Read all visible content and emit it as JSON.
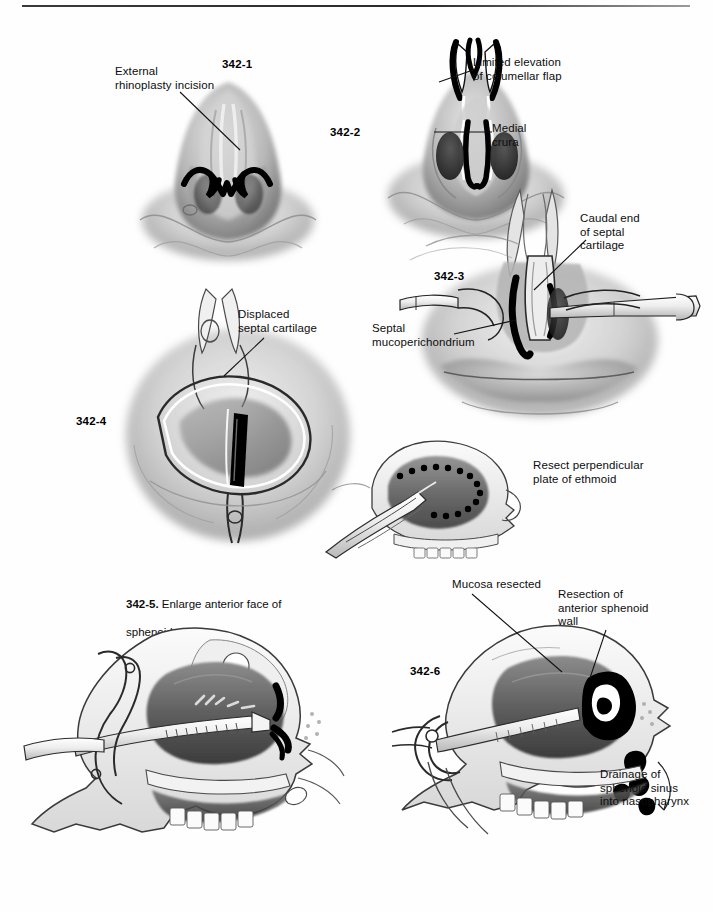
{
  "page": {
    "width": 713,
    "height": 912,
    "background": "#ffffff",
    "ink": "#111111",
    "rule_color": "#3a3a3a"
  },
  "figures": [
    {
      "id": "342-1",
      "number": "342-1",
      "subject": "Base view of nose showing external rhinoplasty incision",
      "labels": [
        {
          "text": "External\nrhinoplasty incision"
        }
      ]
    },
    {
      "id": "342-2",
      "number": "342-2",
      "subject": "Columellar flap elevated exposing medial crura",
      "labels": [
        {
          "text": "Limited elevation\nof columellar flap"
        },
        {
          "text": "Medial\ncrura"
        }
      ]
    },
    {
      "id": "342-3",
      "number": "342-3",
      "subject": "Retractors exposing caudal septum and mucoperichondrium",
      "labels": [
        {
          "text": "Caudal end\nof septal\ncartilage"
        },
        {
          "text": "Septal\nmucoperichondrium"
        }
      ]
    },
    {
      "id": "342-4",
      "number": "342-4",
      "subject": "Speculum view of displaced septal cartilage",
      "labels": [
        {
          "text": "Displaced\nseptal cartilage"
        }
      ]
    },
    {
      "id": "342-ethmoid",
      "number": "",
      "subject": "Sagittal section, resection of perpendicular plate of ethmoid",
      "labels": [
        {
          "text": "Resect perpendicular\nplate of ethmoid"
        }
      ]
    },
    {
      "id": "342-5",
      "number": "342-5.",
      "caption_bold": "342-5.",
      "caption_rest": " Enlarge anterior face of\nsphenoid wall",
      "subject": "Sagittal section with speculum, enlarging anterior sphenoid face",
      "labels": []
    },
    {
      "id": "342-6",
      "number": "342-6",
      "subject": "Sagittal section showing resected anterior sphenoid wall and drainage",
      "labels": [
        {
          "text": "Mucosa resected"
        },
        {
          "text": "Resection of\nanterior sphenoid\nwall"
        },
        {
          "text": "Drainage of\nsphenoid sinus\ninto nasopharynx"
        }
      ]
    }
  ],
  "text": {
    "external_rhinoplasty_incision": "External\nrhinoplasty incision",
    "fig1_num": "342-1",
    "limited_elevation": "Limited elevation\nof columellar flap",
    "medial_crura": "Medial\ncrura",
    "fig2_num": "342-2",
    "caudal_end": "Caudal end\nof septal\ncartilage",
    "septal_mucoperichondrium": "Septal\nmucoperichondrium",
    "fig3_num": "342-3",
    "displaced_septal_cartilage": "Displaced\nseptal cartilage",
    "fig4_num": "342-4",
    "resect_perpendicular": "Resect perpendicular\nplate of ethmoid",
    "fig5_caption_bold": "342-5.",
    "fig5_caption_rest": " Enlarge anterior face of",
    "fig5_caption_line2": "sphenoid wall",
    "mucosa_resected": "Mucosa resected",
    "resection_anterior": "Resection of\nanterior sphenoid\nwall",
    "fig6_num": "342-6",
    "drainage": "Drainage of\nsphenoid sinus\ninto nasopharynx"
  }
}
